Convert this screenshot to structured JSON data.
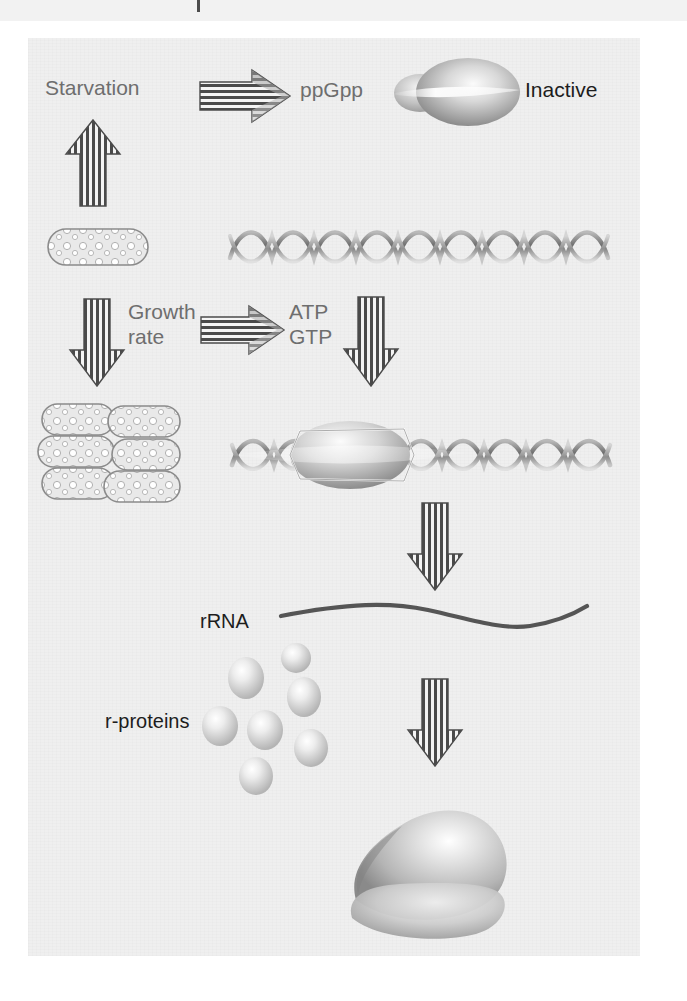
{
  "figure": {
    "kind": "biology-pathway-diagram",
    "topic": "Stringent response control of ribosome synthesis",
    "background_color": "#efefef",
    "page_color": "#ffffff",
    "label_grey": "#6e6e6e",
    "label_dark": "#1d1d1d",
    "ink_grey": "#808080",
    "rrna_stroke": "#555555"
  },
  "labels": {
    "starvation": "Starvation",
    "ppgpp": "ppGpp",
    "inactive": "Inactive",
    "growth": "Growth",
    "rate": "rate",
    "atp": "ATP",
    "gtp": "GTP",
    "rrna": "rRNA",
    "r_proteins": "r-proteins"
  },
  "icons": {
    "arrow_starvation_to_ppgpp": "right-striped-arrow-icon",
    "arrow_up_starvation": "up-striped-arrow-icon",
    "arrow_down_growth": "down-striped-arrow-icon",
    "arrow_growth_to_atp": "right-striped-arrow-icon",
    "arrow_down_atp": "down-striped-arrow-icon",
    "arrow_down_transcription": "down-striped-arrow-icon",
    "arrow_down_assembly": "down-striped-arrow-icon",
    "inactive_ribosome": "inactive-ribosome-icon",
    "single_bacterium": "bacterium-cell-icon",
    "bacteria_colony": "bacteria-colony-icon",
    "dna_helix_bare": "dna-double-helix-icon",
    "dna_helix_with_polymerase": "dna-with-rna-polymerase-icon",
    "rna_polymerase": "rna-polymerase-icon",
    "rrna_strand": "rrna-strand-icon",
    "protein_spheres": "r-protein-spheres-icon",
    "assembled_ribosome": "assembled-ribosome-icon"
  },
  "counts": {
    "colony_cells": 6,
    "protein_spheres": 7,
    "dna_helix_turns_top": 9,
    "dna_helix_turns_bottom": 8
  }
}
